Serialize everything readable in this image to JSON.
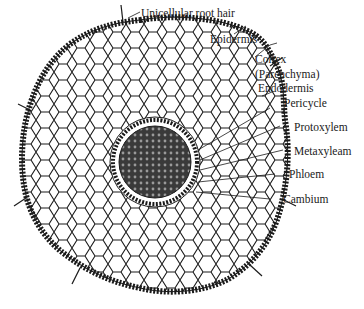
{
  "figure": {
    "labels": [
      {
        "key": "root-hair",
        "text": "Unicellular root hair"
      },
      {
        "key": "epidermis",
        "text": "Epidermis"
      },
      {
        "key": "cortex",
        "text": "Cortex"
      },
      {
        "key": "cortex-sub",
        "text": "(Parenchyma)"
      },
      {
        "key": "endodermis",
        "text": "Endodermis"
      },
      {
        "key": "pericycle",
        "text": "Pericycle"
      },
      {
        "key": "protoxylem",
        "text": "Protoxylem"
      },
      {
        "key": "metaxylem",
        "text": "Metaxyleam"
      },
      {
        "key": "phloem",
        "text": "Phloem"
      },
      {
        "key": "cambium",
        "text": "Cambium"
      }
    ],
    "colors": {
      "ink": "#1a1a1a",
      "background": "#ffffff",
      "stele": "#2a2a2a"
    }
  }
}
